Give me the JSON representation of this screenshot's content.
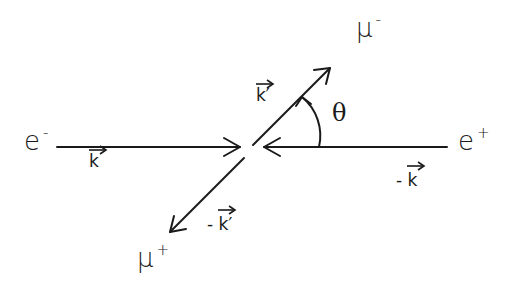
{
  "diagram": {
    "type": "scattering-kinematics",
    "stroke_color": "#1a1a1a",
    "background": "#ffffff",
    "particles": {
      "electron": {
        "symbol": "e",
        "charge": "-"
      },
      "positron": {
        "symbol": "e",
        "charge": "+"
      },
      "muon_minus": {
        "symbol": "μ",
        "charge": "-"
      },
      "muon_plus": {
        "symbol": "μ",
        "charge": "+"
      }
    },
    "momenta": {
      "electron": "k",
      "positron_prefix": "-",
      "positron": "k",
      "muon_minus": "k′",
      "muon_plus_prefix": "-",
      "muon_plus": "k′"
    },
    "angle": {
      "label": "θ"
    }
  }
}
